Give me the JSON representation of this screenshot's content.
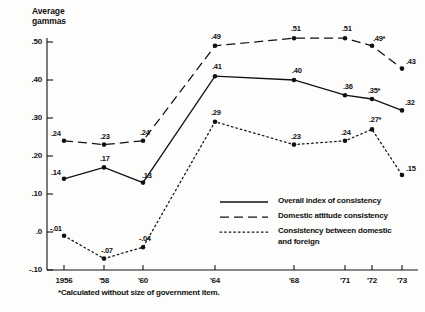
{
  "chart_data": {
    "type": "line",
    "title": "",
    "ylabel": "Average gammas",
    "xlabel": "",
    "ylim": [
      -0.1,
      0.52
    ],
    "yticks": [
      ".50",
      ".40",
      ".30",
      ".20",
      ".10",
      ".0",
      "-.10"
    ],
    "ytick_values": [
      0.5,
      0.4,
      0.3,
      0.2,
      0.1,
      0.0,
      -0.1
    ],
    "categories": [
      "1956",
      "'58",
      "'60",
      "'64",
      "'68",
      "'71",
      "'72",
      "'73"
    ],
    "x_values": [
      1956,
      1958,
      1960,
      1964,
      1968,
      1971,
      1972,
      1973
    ],
    "grid": false,
    "legend_position": "inside-lower-right",
    "series": [
      {
        "name": "Overall index of consistency",
        "style": "solid",
        "values": [
          0.14,
          0.17,
          0.13,
          0.41,
          0.4,
          0.36,
          0.35,
          0.32
        ],
        "labels": [
          ".14",
          ".17",
          ".13",
          ".41",
          ".40",
          ".36",
          ".35*",
          ".32"
        ]
      },
      {
        "name": "Domestic attitude consistency",
        "style": "dashed",
        "values": [
          0.24,
          0.23,
          0.24,
          0.49,
          0.51,
          0.51,
          0.49,
          0.43
        ],
        "labels": [
          ".24",
          ".23",
          ".24",
          ".49",
          ".51",
          ".51",
          ".49*",
          ".43"
        ]
      },
      {
        "name": "Consistency between domestic and foreign",
        "style": "dotted",
        "values": [
          -0.01,
          -0.07,
          -0.04,
          0.29,
          0.23,
          0.24,
          0.27,
          0.15
        ],
        "labels": [
          "-.01",
          "-.07",
          "-.04",
          ".29",
          ".23",
          ".24",
          ".27*",
          ".15"
        ]
      }
    ],
    "annotations": [
      "*Calculated without size of government item."
    ]
  },
  "legend": {
    "items": [
      {
        "label": "Overall index of consistency",
        "style": "solid"
      },
      {
        "label": "Domestic attitude consistency",
        "style": "dashed"
      },
      {
        "label": "Consistency between domestic",
        "label2": "and foreign",
        "style": "dotted"
      }
    ]
  },
  "footnote": "*Calculated without size of government item.",
  "axis_title": {
    "line1": "Average",
    "line2": "gammas"
  },
  "colors": {
    "ink": "#111111",
    "background": "#fdfdfb"
  }
}
